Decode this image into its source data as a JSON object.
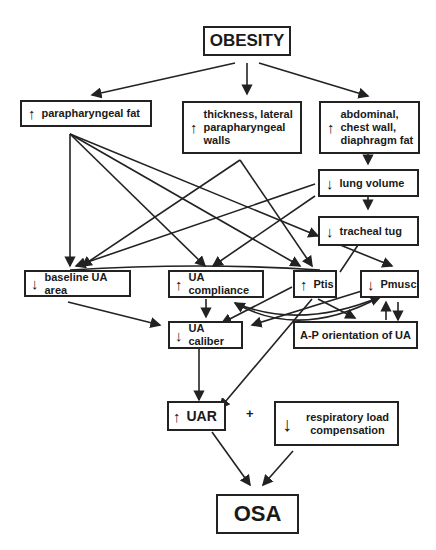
{
  "diagram": {
    "nodes": {
      "obesity": {
        "label": "OBESITY"
      },
      "parapharyngeal_fat": {
        "arrow": "↑",
        "label": "parapharyngeal fat"
      },
      "thickness_walls": {
        "arrow": "↑",
        "label": "thickness, lateral parapharyngeal walls"
      },
      "abdominal_fat": {
        "arrow": "↑",
        "label": "abdominal, chest wall, diaphragm fat"
      },
      "lung_volume": {
        "arrow": "↓",
        "label": "lung volume"
      },
      "tracheal_tug": {
        "arrow": "↓",
        "label": "tracheal tug"
      },
      "baseline_ua_area": {
        "arrow": "↓",
        "label": "baseline UA area"
      },
      "ua_compliance": {
        "arrow": "↑",
        "label": "UA compliance"
      },
      "ptis": {
        "arrow": "↑",
        "label": "Ptis"
      },
      "pmusc": {
        "arrow": "↓",
        "label": "Pmusc"
      },
      "ua_caliber": {
        "arrow": "↓",
        "label": "UA caliber"
      },
      "ap_orientation": {
        "label": "A-P orientation of UA"
      },
      "uar": {
        "arrow": "↑",
        "label": "UAR"
      },
      "resp_load": {
        "arrow": "↓",
        "label": "respiratory load compensation"
      },
      "osa": {
        "label": "OSA"
      }
    },
    "plus_sign": "+"
  }
}
